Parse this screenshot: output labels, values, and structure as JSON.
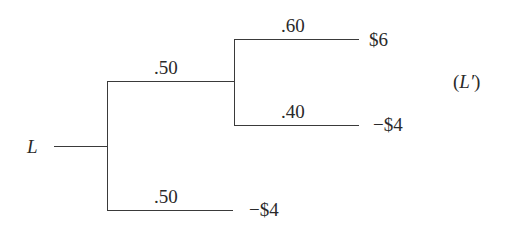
{
  "diagram": {
    "type": "decision-tree",
    "root": {
      "label": "L"
    },
    "compound_label": "(L′)",
    "branches": [
      {
        "id": "upper",
        "probability": ".50",
        "children": [
          {
            "id": "upper-top",
            "probability": ".60",
            "outcome": "$6"
          },
          {
            "id": "upper-bottom",
            "probability": ".40",
            "outcome": "−$4"
          }
        ]
      },
      {
        "id": "lower",
        "probability": ".50",
        "outcome": "−$4"
      }
    ],
    "line_color": "#3a3a3a",
    "text_color": "#2a2a2a"
  }
}
